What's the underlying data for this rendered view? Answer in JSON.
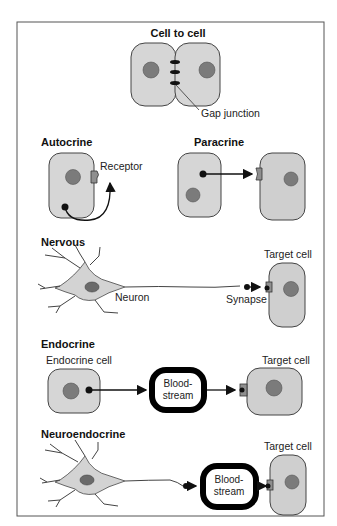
{
  "panels": {
    "cell_to_cell": {
      "title": "Cell to cell",
      "gap_label": "Gap junction"
    },
    "autocrine": {
      "title": "Autocrine",
      "receptor_label": "Receptor"
    },
    "paracrine": {
      "title": "Paracrine"
    },
    "nervous": {
      "title": "Nervous",
      "neuron_label": "Neuron",
      "synapse_label": "Synapse",
      "target_label": "Target cell"
    },
    "endocrine": {
      "title": "Endocrine",
      "source_label": "Endocrine cell",
      "blood1": "Blood-",
      "blood2": "stream",
      "target_label": "Target cell"
    },
    "neuroendocrine": {
      "title": "Neuroendocrine",
      "blood1": "Blood-",
      "blood2": "stream",
      "target_label": "Target cell"
    }
  },
  "colors": {
    "cell_fill": "#d6d6d6",
    "nucleus": "#7b7b7b",
    "bloodstream": "#000000",
    "frame": "#555555"
  }
}
